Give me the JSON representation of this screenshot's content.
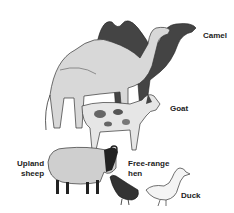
{
  "illustration": {
    "subject": "livestock animals illustration",
    "labels": {
      "camel": "Camel",
      "goat": "Goat",
      "sheep_line1": "Upland",
      "sheep_line2": "sheep",
      "hen_line1": "Free-range",
      "hen_line2": "hen",
      "duck": "Duck"
    }
  }
}
